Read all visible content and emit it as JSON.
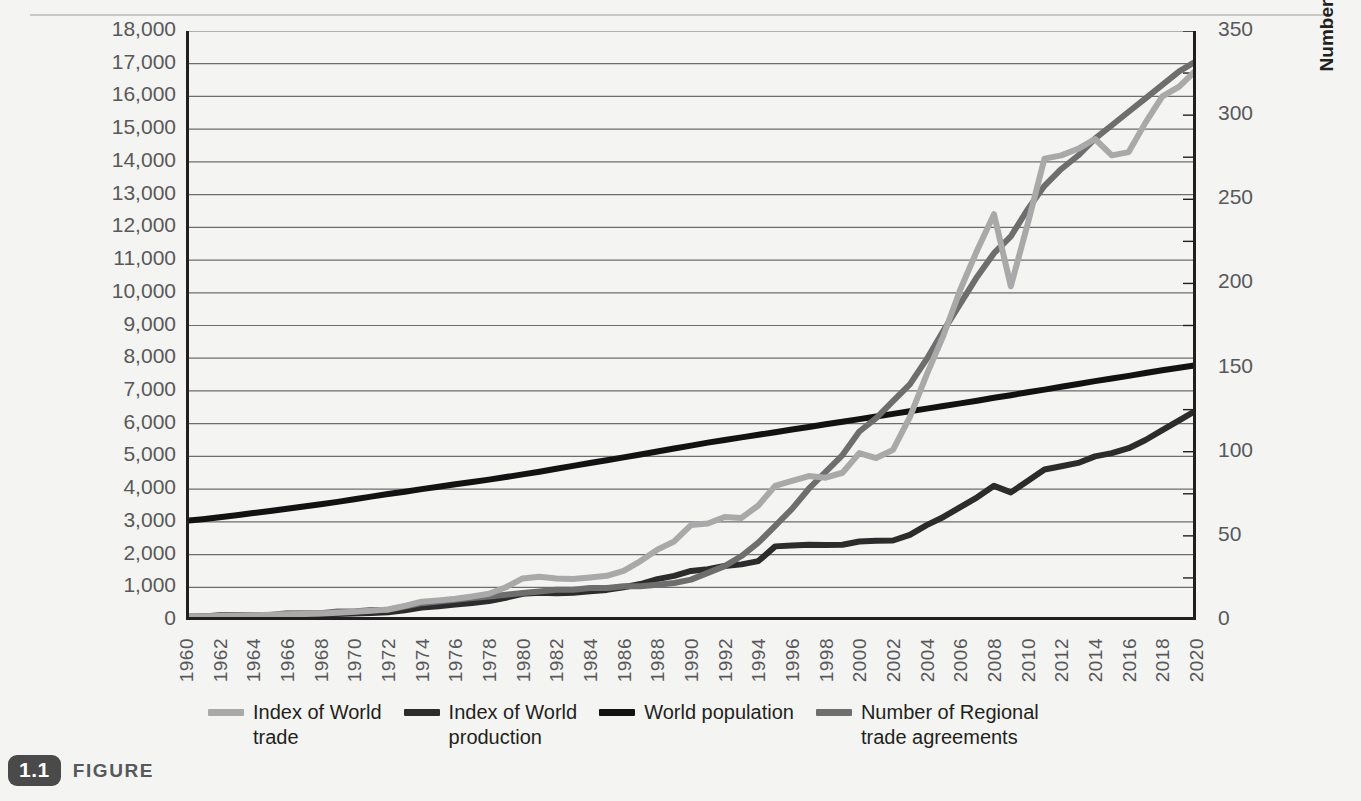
{
  "figure": {
    "badge": "1.1",
    "word": "FIGURE"
  },
  "axes": {
    "y_left_title": "Index Value for World Trade and Production\n1960=100 and Population (in billions)",
    "y_right_title": "Number of Regional Trade Agreements",
    "y_left_ticks": [
      "0",
      "1,000",
      "2,000",
      "3,000",
      "4,000",
      "5,000",
      "6,000",
      "7,000",
      "8,000",
      "9,000",
      "10,000",
      "11,000",
      "12,000",
      "13,000",
      "14,000",
      "15,000",
      "16,000",
      "17,000",
      "18,000"
    ],
    "y_right_ticks": [
      "0",
      "50",
      "100",
      "150",
      "200",
      "250",
      "300",
      "350"
    ],
    "x_ticks": [
      "1960",
      "1962",
      "1964",
      "1966",
      "1968",
      "1970",
      "1972",
      "1974",
      "1976",
      "1978",
      "1980",
      "1982",
      "1984",
      "1986",
      "1988",
      "1990",
      "1992",
      "1994",
      "1996",
      "1998",
      "2000",
      "2002",
      "2004",
      "2006",
      "2008",
      "2010",
      "2012",
      "2014",
      "2016",
      "2018",
      "2020"
    ]
  },
  "legend": {
    "position": "bottom",
    "items": [
      {
        "label": "Index of World\ntrade",
        "color": "#a9a9a9",
        "name": "index-of-world-trade"
      },
      {
        "label": "Index of World\nproduction",
        "color": "#2c2c2c",
        "name": "index-of-world-production"
      },
      {
        "label": "World population",
        "color": "#121212",
        "name": "world-population"
      },
      {
        "label": "Number of Regional\ntrade agreements",
        "color": "#6e6e6e",
        "name": "number-of-regional-trade-agreements"
      }
    ]
  },
  "colors": {
    "background": "#f4f4f2",
    "axis": "#231f20",
    "grid": "#6d6d6d",
    "tick_text": "#58585b",
    "trade": "#a9a9a9",
    "production": "#2c2c2c",
    "population": "#121212",
    "rta": "#6e6e6e"
  },
  "chart_data": {
    "type": "line",
    "title": "",
    "xlabel": "",
    "ylabel": "Index Value for World Trade and Production 1960=100 and Population (in billions)",
    "y2label": "Number of Regional Trade Agreements",
    "ylim": [
      0,
      18000
    ],
    "y2lim": [
      0,
      350
    ],
    "xlim": [
      1960,
      2020
    ],
    "grid": true,
    "legend_position": "bottom",
    "x": [
      1960,
      1961,
      1962,
      1963,
      1964,
      1965,
      1966,
      1967,
      1968,
      1969,
      1970,
      1971,
      1972,
      1973,
      1974,
      1975,
      1976,
      1977,
      1978,
      1979,
      1980,
      1981,
      1982,
      1983,
      1984,
      1985,
      1986,
      1987,
      1988,
      1989,
      1990,
      1991,
      1992,
      1993,
      1994,
      1995,
      1996,
      1997,
      1998,
      1999,
      2000,
      2001,
      2002,
      2003,
      2004,
      2005,
      2006,
      2007,
      2008,
      2009,
      2010,
      2011,
      2012,
      2013,
      2014,
      2015,
      2016,
      2017,
      2018,
      2019,
      2020
    ],
    "series": [
      {
        "name": "Index of World trade",
        "axis": "left",
        "color": "#a9a9a9",
        "values": [
          100,
          110,
          120,
          130,
          145,
          160,
          175,
          185,
          200,
          225,
          250,
          280,
          320,
          430,
          560,
          600,
          650,
          720,
          800,
          1000,
          1270,
          1320,
          1270,
          1250,
          1300,
          1350,
          1500,
          1800,
          2150,
          2400,
          2900,
          2950,
          3150,
          3120,
          3500,
          4100,
          4250,
          4400,
          4350,
          4500,
          5100,
          4950,
          5200,
          6200,
          7500,
          8700,
          10100,
          11300,
          12400,
          10200,
          12100,
          14100,
          14200,
          14400,
          14700,
          14200,
          14300,
          15200,
          16000,
          16300,
          16800
        ]
      },
      {
        "name": "Index of World production",
        "axis": "left",
        "color": "#2c2c2c",
        "values": [
          100,
          105,
          112,
          120,
          130,
          140,
          150,
          158,
          170,
          185,
          200,
          215,
          235,
          300,
          380,
          420,
          470,
          520,
          580,
          680,
          800,
          830,
          820,
          830,
          880,
          920,
          1000,
          1100,
          1250,
          1350,
          1500,
          1550,
          1650,
          1700,
          1800,
          2250,
          2280,
          2300,
          2290,
          2300,
          2400,
          2420,
          2430,
          2600,
          2900,
          3150,
          3450,
          3750,
          4100,
          3900,
          4250,
          4600,
          4700,
          4800,
          5000,
          5100,
          5250,
          5500,
          5800,
          6100,
          6400
        ]
      },
      {
        "name": "World population",
        "axis": "left",
        "color": "#121212",
        "values": [
          3030,
          3080,
          3140,
          3200,
          3270,
          3330,
          3400,
          3470,
          3540,
          3610,
          3690,
          3770,
          3850,
          3920,
          4000,
          4070,
          4150,
          4220,
          4290,
          4370,
          4450,
          4530,
          4620,
          4710,
          4800,
          4880,
          4970,
          5060,
          5150,
          5240,
          5330,
          5420,
          5500,
          5580,
          5660,
          5740,
          5820,
          5900,
          5980,
          6060,
          6140,
          6220,
          6300,
          6380,
          6460,
          6540,
          6620,
          6700,
          6790,
          6870,
          6960,
          7040,
          7130,
          7210,
          7300,
          7380,
          7460,
          7550,
          7630,
          7710,
          7790
        ]
      },
      {
        "name": "Number of Regional trade agreements",
        "axis": "right",
        "color": "#6e6e6e",
        "values": [
          2,
          2,
          3,
          3,
          3,
          3,
          4,
          4,
          4,
          5,
          5,
          6,
          6,
          8,
          10,
          11,
          12,
          13,
          14,
          15,
          16,
          17,
          18,
          18,
          19,
          19,
          20,
          20,
          21,
          22,
          24,
          28,
          32,
          38,
          46,
          56,
          66,
          78,
          88,
          98,
          112,
          120,
          130,
          140,
          155,
          172,
          188,
          204,
          218,
          228,
          244,
          258,
          268,
          276,
          286,
          294,
          302,
          310,
          318,
          326,
          332
        ]
      }
    ]
  }
}
